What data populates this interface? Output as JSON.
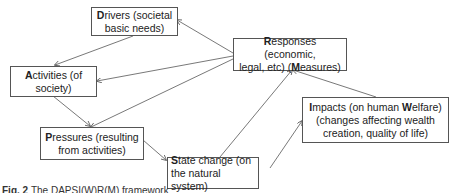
{
  "diagram": {
    "nodes": [
      {
        "id": "drivers",
        "initial": "D",
        "rest": "rivers (societal",
        "line2": "basic needs)"
      },
      {
        "id": "activities",
        "initial": "A",
        "rest": "ctivities (of",
        "line2": "society)"
      },
      {
        "id": "pressures",
        "initial": "P",
        "rest": "ressures (resulting",
        "line2": "from activities)"
      },
      {
        "id": "state",
        "initial": "S",
        "rest": "tate change (on",
        "line2": "the natural system)"
      },
      {
        "id": "impacts",
        "initial": "I",
        "rest": "mpacts (on human ",
        "bold2": "W",
        "rest2": "elfare)",
        "line2": "(changes affecting wealth",
        "line3": "creation, quality of life)"
      },
      {
        "id": "responses",
        "initial": "R",
        "rest": "esponses (economic,",
        "line2a": "legal, etc) (",
        "bold2": "M",
        "line2b": "easures)"
      }
    ],
    "edges": [
      {
        "from": "drivers",
        "to": "activities"
      },
      {
        "from": "activities",
        "to": "pressures"
      },
      {
        "from": "pressures",
        "to": "state"
      },
      {
        "from": "state",
        "to": "impacts"
      },
      {
        "from": "state",
        "to": "responses"
      },
      {
        "from": "impacts",
        "to": "responses"
      },
      {
        "from": "responses",
        "to": "drivers"
      },
      {
        "from": "responses",
        "to": "activities"
      },
      {
        "from": "responses",
        "to": "pressures"
      }
    ]
  },
  "caption": {
    "label": "Fig. 2",
    "text": "The DAPSI(W)R(M) framework"
  },
  "colors": {
    "border": "#555555",
    "arrow": "#555555",
    "text": "#222222"
  }
}
